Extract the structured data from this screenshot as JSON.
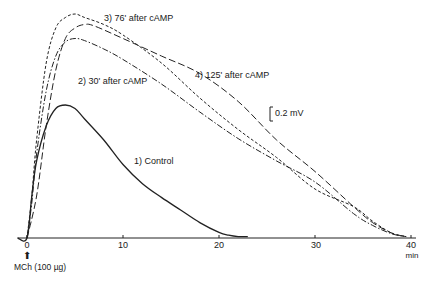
{
  "chart_data": {
    "type": "line",
    "title": "",
    "xlabel": "min",
    "ylabel": "",
    "xlim": [
      0,
      40
    ],
    "x_ticks": [
      0,
      10,
      20,
      30,
      40
    ],
    "x_tick_labels": [
      "0",
      "10",
      "20",
      "30",
      "40"
    ],
    "x_unit_label": "min",
    "grid": false,
    "stimulus_annotation": {
      "x": 0,
      "label": "MCh (100 µg)",
      "icon": "up-arrow-icon"
    },
    "scale_bar": {
      "label": "0.2 mV",
      "value_mV": 0.2
    },
    "y_unit": "mV",
    "series": [
      {
        "name": "1) Control",
        "style": "solid",
        "x": [
          -1,
          0,
          0.5,
          1,
          2,
          3,
          4,
          5,
          6,
          8,
          10,
          12,
          14,
          16,
          18,
          20,
          21,
          22,
          23
        ],
        "y": [
          0,
          0,
          0.6,
          1.1,
          1.6,
          1.85,
          1.9,
          1.85,
          1.7,
          1.4,
          1.05,
          0.78,
          0.58,
          0.4,
          0.22,
          0.08,
          0.04,
          0.02,
          0.02
        ]
      },
      {
        "name": "2) 30' after cAMP",
        "style": "dash-dot",
        "x": [
          0,
          0.5,
          1,
          2,
          3,
          4,
          5,
          6,
          8,
          10,
          14,
          18,
          22,
          26,
          30,
          34,
          36,
          38,
          39.5
        ],
        "y": [
          0,
          0.5,
          1.2,
          2.1,
          2.6,
          2.8,
          2.85,
          2.82,
          2.7,
          2.55,
          2.2,
          1.8,
          1.42,
          1.1,
          0.8,
          0.35,
          0.18,
          0.06,
          0.02
        ]
      },
      {
        "name": "3) 76' after cAMP",
        "style": "short-dash",
        "x": [
          0,
          0.5,
          1,
          2,
          3,
          4,
          5,
          6,
          8,
          10,
          14,
          18,
          22,
          26,
          30,
          34,
          36,
          38,
          39.5
        ],
        "y": [
          0,
          0.6,
          1.4,
          2.5,
          3.0,
          3.15,
          3.2,
          3.15,
          3.05,
          2.9,
          2.5,
          2.0,
          1.55,
          1.15,
          0.7,
          0.45,
          0.24,
          0.07,
          0.02
        ]
      },
      {
        "name": "4) 125' after cAMP",
        "style": "long-dash",
        "x": [
          0,
          1,
          2,
          3,
          4,
          5,
          6,
          7,
          10,
          14,
          18,
          22,
          26,
          30,
          34,
          36,
          38,
          39.5
        ],
        "y": [
          0,
          0.6,
          1.6,
          2.4,
          2.85,
          3.0,
          3.05,
          3.03,
          2.85,
          2.6,
          2.35,
          1.95,
          1.4,
          0.95,
          0.45,
          0.22,
          0.07,
          0.02
        ]
      }
    ]
  },
  "labels": {
    "control": "1) Control",
    "s2": "2) 30' after cAMP",
    "s3": "3) 76' after cAMP",
    "s4": "4) 125' after cAMP",
    "scale": "0.2 mV",
    "stim": "MCh (100 µg)",
    "unit": "min",
    "ticks": [
      "0",
      "10",
      "20",
      "30",
      "40"
    ]
  }
}
